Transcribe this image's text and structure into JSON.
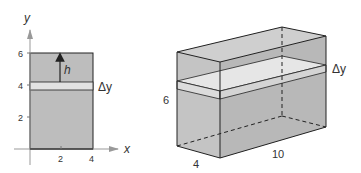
{
  "left_figure": {
    "axis_x_label": "x",
    "axis_y_label": "y",
    "x_ticks": [
      "2",
      "4"
    ],
    "y_ticks": [
      "2",
      "4",
      "6"
    ],
    "height_label": "h",
    "strip_label": "Δy"
  },
  "right_figure": {
    "height_label": "6",
    "depth_label": "4",
    "width_label": "10",
    "strip_label": "Δy"
  },
  "colors": {
    "fill": "#bdbdbd",
    "strip": "#e2e2e2",
    "stroke": "#222222"
  }
}
